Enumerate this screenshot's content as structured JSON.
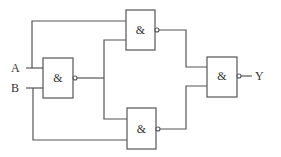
{
  "diagram": {
    "type": "logic-circuit",
    "inputs": [
      {
        "id": "A",
        "label": "A"
      },
      {
        "id": "B",
        "label": "B"
      }
    ],
    "output": {
      "id": "Y",
      "label": "Y"
    },
    "gates": [
      {
        "id": "g1",
        "symbol": "&",
        "kind": "NAND",
        "inputs": [
          "A",
          "B"
        ]
      },
      {
        "id": "g2",
        "symbol": "&",
        "kind": "NAND",
        "inputs": [
          "A",
          "g1"
        ]
      },
      {
        "id": "g3",
        "symbol": "&",
        "kind": "NAND",
        "inputs": [
          "g1",
          "B"
        ]
      },
      {
        "id": "g4",
        "symbol": "&",
        "kind": "NAND",
        "inputs": [
          "g2",
          "g3"
        ]
      }
    ],
    "colors": {
      "line": "#555555",
      "text": "#333333",
      "background": "#ffffff"
    }
  }
}
